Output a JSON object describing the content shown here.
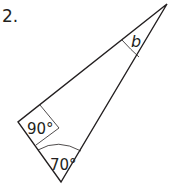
{
  "question": {
    "number": "2."
  },
  "triangle": {
    "vertices": {
      "top": [
        167,
        4
      ],
      "left": [
        18,
        122
      ],
      "bottom": [
        61,
        182
      ]
    },
    "angles": {
      "left": {
        "label": "90°",
        "type": "right-angle"
      },
      "bottom": {
        "label": "70°"
      },
      "top": {
        "label": "b"
      }
    },
    "stroke_color": "#231f20"
  }
}
